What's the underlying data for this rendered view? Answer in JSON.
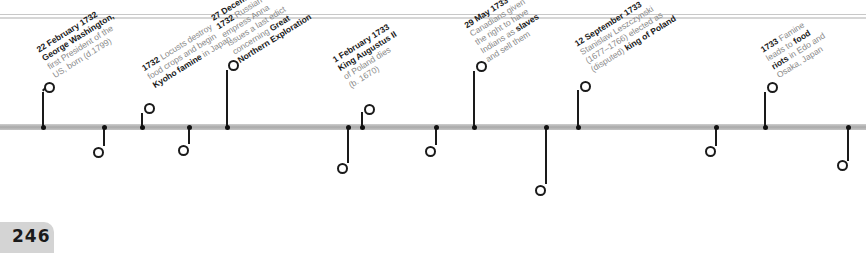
{
  "page": {
    "number": "246"
  },
  "timeline": {
    "above": [
      {
        "x": 43,
        "bold_pre": "22 February 1732",
        "parts": [
          {
            "t": "22 February 1732",
            "b": true
          },
          {
            "t": "George Washington,",
            "b": true
          },
          {
            "t": "first President of the",
            "b": false
          },
          {
            "t": "US, born (d.1799)",
            "b": false
          }
        ]
      },
      {
        "x": 142,
        "parts": [
          {
            "t": "1732 Locusts destroy",
            "b": false
          },
          {
            "t": "food crops and begin",
            "b": false
          },
          {
            "t": "Kyoho famine in Japan",
            "b": false
          }
        ]
      },
      {
        "x": 227,
        "parts": [
          {
            "t": "27 December",
            "b": true
          },
          {
            "t": "1732 Russian",
            "b": false
          },
          {
            "t": "empress Anna",
            "b": false
          },
          {
            "t": "issues a last edict",
            "b": false
          },
          {
            "t": "concerning Great",
            "b": false
          },
          {
            "t": "Northern Exploration",
            "b": true
          }
        ]
      },
      {
        "x": 362,
        "parts": [
          {
            "t": "1 February 1733",
            "b": true
          },
          {
            "t": "King Augustus II",
            "b": true
          },
          {
            "t": "of Poland dies",
            "b": false
          },
          {
            "t": "(b. 1670)",
            "b": false
          }
        ]
      },
      {
        "x": 474,
        "parts": [
          {
            "t": "29 May 1733",
            "b": true
          },
          {
            "t": "Canadians given",
            "b": false
          },
          {
            "t": "the right to have",
            "b": false
          },
          {
            "t": "Indians as slaves",
            "b": false
          },
          {
            "t": "and sell them",
            "b": false
          }
        ]
      },
      {
        "x": 578,
        "parts": [
          {
            "t": "12 September 1733",
            "b": true
          },
          {
            "t": "Stanislaw Leszczynski",
            "b": false
          },
          {
            "t": "(1677–1766) elected as",
            "b": false
          },
          {
            "t": "(disputed) king of Poland",
            "b": false
          }
        ]
      },
      {
        "x": 765,
        "parts": [
          {
            "t": "1733 Famine",
            "b": false
          },
          {
            "t": "leads to food",
            "b": false
          },
          {
            "t": "riots in Edo and",
            "b": false
          },
          {
            "t": "Osaka, Japan",
            "b": false
          }
        ]
      }
    ],
    "below": [
      {
        "x": 104,
        "lines": [
          "1732 King Frederick",
          "William I of Prussia",
          "institutes conscript",
          "training system"
        ]
      },
      {
        "x": 189,
        "lines": [
          "9 June 1732 King",
          "George II of Britain",
          "grants charter for",
          "establishment of",
          "state of Georgia"
        ]
      },
      {
        "x": 348,
        "lines": [
          "1732–33 British artist",
          "William Hogarth completes",
          "eight-painting series",
          "A Rake's Progress"
        ]
      },
      {
        "x": 436,
        "lines": [
          "12 February 1733",
          "first British settlers",
          "land at Savannah,",
          "Georgia"
        ]
      },
      {
        "x": 546,
        "lines": [
          "July 1733 British",
          "inventor John Kay",
          "begins manufacturing",
          "flying-shuttle loom"
        ]
      },
      {
        "x": 716,
        "lines": [
          "10 October 1733 France",
          "declares war on Austria",
          "in War of the Polish",
          "Succession"
        ]
      },
      {
        "x": 848,
        "lines": [
          "30 June 1734",
          "Stanislaw is deposed",
          "and Augustus III",
          "becomes king",
          "of Poland"
        ]
      }
    ]
  },
  "text": {
    "e1": [
      "<b>22 February 1732</b>",
      "<b>George Washington,</b>",
      "first President of the",
      "US, born (d.1799)"
    ],
    "a": {
      "a1_l1": "22 February 1732",
      "a1_l2": "George Washington,",
      "a1_l3": "first President of the",
      "a1_l4": "US, born (d.1799)",
      "a2_b": "1732",
      "a2_l1": " Locusts destroy",
      "a2_l2": "food crops and begin",
      "a2_l3b": "Kyoho famine",
      "a2_l3": " in Japan",
      "a3_l1": "27 December",
      "a3_l2b": "1732",
      "a3_l2": " Russian",
      "a3_l3": "empress Anna",
      "a3_l4": "issues a last edict",
      "a3_l5": "concerning ",
      "a3_l5b": "Great",
      "a3_l6": "Northern Exploration",
      "a4_l1": "1 February 1733",
      "a4_l2": "King Augustus II",
      "a4_l3": "of Poland dies",
      "a4_l4": "(b. 1670)",
      "a5_l1": "29 May 1733",
      "a5_l2": "Canadians given",
      "a5_l3": "the right to have",
      "a5_l4": "Indians as ",
      "a5_l4b": "slaves",
      "a5_l5": "and sell them",
      "a6_l1": "12 September 1733",
      "a6_l2": "Stanislaw Leszczynski",
      "a6_l3": "(1677–1766) elected as",
      "a6_l4": "(disputed) ",
      "a6_l4b": "king of Poland",
      "a7_b": "1733",
      "a7_l1": " Famine",
      "a7_l2": "leads to ",
      "a7_l2b": "food",
      "a7_l3b": "riots",
      "a7_l3": " in Edo and",
      "a7_l4": "Osaka, Japan"
    },
    "b": {
      "b1_b": "1732",
      "b1_l1": " King Frederick",
      "b1_l2": "William I of Prussia",
      "b1_l3": "institutes ",
      "b1_l3b": "conscript",
      "b1_l4b": "training system",
      "b2_b": "9 June 1732",
      "b2_l1": " King",
      "b2_l2": "George II of Britain",
      "b2_l3": "grants charter for",
      "b2_l4": "establishment of",
      "b2_l5": "state of ",
      "b2_l5b": "Georgia",
      "b3_b": "1732–33",
      "b3_l1": " British artist",
      "b3_l2b": "William Hogarth",
      "b3_l2": " completes",
      "b3_l3": "eight-painting series",
      "b3_l4": "A Rake's Progress",
      "b4_l1": "12 February 1733",
      "b4_l2": "first British settlers",
      "b4_l3": "land at ",
      "b4_l3b": "Savannah,",
      "b4_l4": "Georgia",
      "b5_b": "July 1733",
      "b5_l1": " British",
      "b5_l2": "inventor John Kay",
      "b5_l3": "begins manufacturing",
      "b5_l4b": "flying-shuttle loom",
      "b6_b": "10 October 1733",
      "b6_l1": " France",
      "b6_l2": "declares war on Austria",
      "b6_l3": "in ",
      "b6_l3b": "War of the Polish",
      "b6_l4b": "Succession",
      "b7_l1": "30 June 1734",
      "b7_l2": "Stanislaw is deposed",
      "b7_l3": "and ",
      "b7_l3b": "Augustus III",
      "b7_l4": "becomes king",
      "b7_l5": "of Poland"
    }
  }
}
